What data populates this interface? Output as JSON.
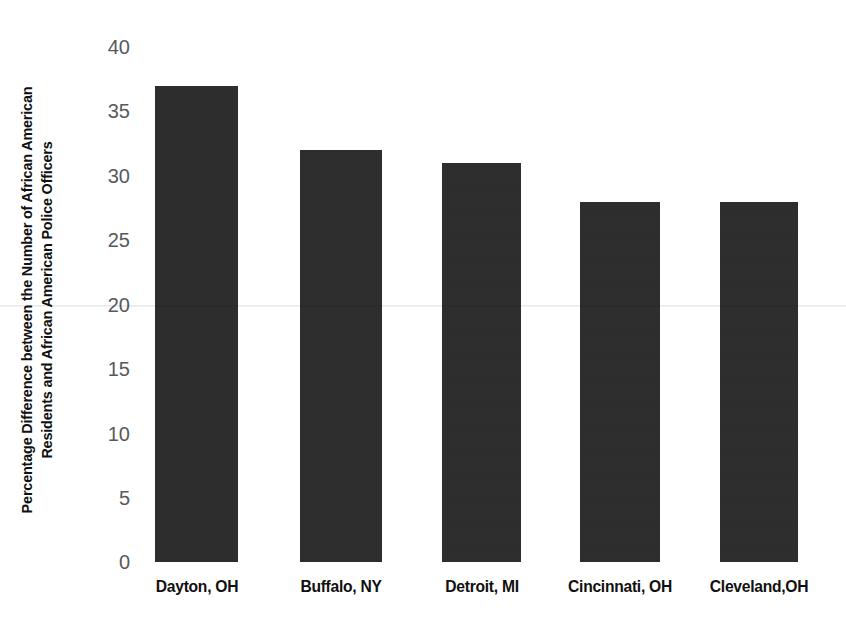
{
  "chart_data": {
    "type": "bar",
    "title": "",
    "xlabel": "",
    "ylabel_lines": [
      "Percentage Difference between the Number of African American",
      "Residents and African American Police Officers"
    ],
    "ylabel": "Percentage Difference between the Number of African American Residents and African American Police Officers",
    "categories": [
      "Dayton, OH",
      "Buffalo, NY",
      "Detroit, MI",
      "Cincinnati, OH",
      "Cleveland,OH"
    ],
    "values": [
      37,
      32,
      31,
      28,
      28
    ],
    "ylim": [
      0,
      40
    ],
    "yticks": [
      40,
      35,
      30,
      25,
      20,
      15,
      10,
      5,
      0
    ],
    "ytick_labels": [
      "40",
      "35",
      "30",
      "25",
      "20",
      "15",
      "10",
      "5",
      "0"
    ],
    "grid": false,
    "legend": null,
    "bar_color": "#2b2b2b",
    "background_color": "#ffffff",
    "tick_label_color": "#58595b",
    "axis_label_color": "#101010"
  }
}
